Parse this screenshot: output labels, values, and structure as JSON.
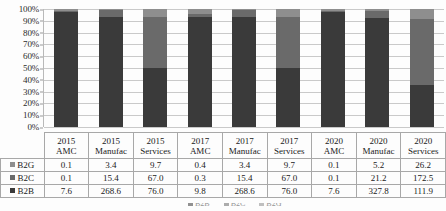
{
  "chart_data": {
    "type": "bar",
    "subtype": "100% stacked column",
    "title": "",
    "xlabel": "",
    "ylabel": "",
    "ylim": [
      0,
      100
    ],
    "ytick_labels": [
      "100%",
      "90%",
      "80%",
      "70%",
      "60%",
      "50%",
      "40%",
      "30%",
      "20%",
      "10%",
      "0%"
    ],
    "ytick_values": [
      100,
      90,
      80,
      70,
      60,
      50,
      40,
      30,
      20,
      10,
      0
    ],
    "grid": true,
    "legend_position": "bottom",
    "categories": [
      "2015 AMC",
      "2015 Manufac",
      "2015 Services",
      "2017 AMC",
      "2017 Manufac",
      "2017 Services",
      "2020 AMC",
      "2020 Manufac",
      "2020 Services"
    ],
    "category_lines": [
      [
        "2015",
        "AMC"
      ],
      [
        "2015",
        "Manufac"
      ],
      [
        "2015",
        "Services"
      ],
      [
        "2017",
        "AMC"
      ],
      [
        "2017",
        "Manufac"
      ],
      [
        "2017",
        "Services"
      ],
      [
        "2020",
        "AMC"
      ],
      [
        "2020",
        "Manufac"
      ],
      [
        "2020",
        "Services"
      ]
    ],
    "series": [
      {
        "name": "B2G",
        "color": "#8e8e8e",
        "values": [
          0.1,
          3.4,
          9.7,
          0.4,
          3.4,
          9.7,
          0.1,
          5.2,
          26.2
        ],
        "labels": [
          "0.1",
          "3.4",
          "9.7",
          "0.4",
          "3.4",
          "9.7",
          "0.1",
          "5.2",
          "26.2"
        ]
      },
      {
        "name": "B2C",
        "color": "#6a6a6a",
        "values": [
          0.1,
          15.4,
          67.0,
          0.3,
          15.4,
          67.0,
          0.1,
          21.2,
          172.5
        ],
        "labels": [
          "0.1",
          "15.4",
          "67.0",
          "0.3",
          "15.4",
          "67.0",
          "0.1",
          "21.2",
          "172.5"
        ]
      },
      {
        "name": "B2B",
        "color": "#3a3a3a",
        "values": [
          7.6,
          268.6,
          76.0,
          9.8,
          268.6,
          76.0,
          7.6,
          327.8,
          111.9
        ],
        "labels": [
          "7.6",
          "268.6",
          "76.0",
          "9.8",
          "268.6",
          "76.0",
          "7.6",
          "327.8",
          "111.9"
        ]
      }
    ],
    "stack_order_bottom_to_top": [
      "B2B",
      "B2C",
      "B2G"
    ]
  },
  "table": {
    "row_order": [
      "B2G",
      "B2C",
      "B2B"
    ]
  }
}
